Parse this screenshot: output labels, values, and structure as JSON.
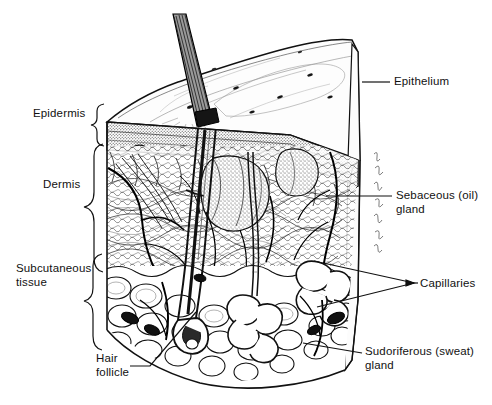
{
  "figure": {
    "style": "pen-and-ink line illustration, black on white",
    "background_color": "#ffffff",
    "ink_color": "#000000",
    "signature": "artist signature along right edge of block"
  },
  "labels": {
    "left": [
      {
        "id": "epidermis",
        "text": "Epidermis",
        "connector": "brace",
        "x": 33,
        "y": 107
      },
      {
        "id": "dermis",
        "text": "Dermis",
        "connector": "brace",
        "x": 43,
        "y": 178
      },
      {
        "id": "subcutaneous",
        "text": "Subcutaneous\ntissue",
        "connector": "brace",
        "x": 16,
        "y": 262
      }
    ],
    "right": [
      {
        "id": "epithelium",
        "text": "Epithelium",
        "connector": "line",
        "x": 394,
        "y": 75
      },
      {
        "id": "sebaceous",
        "text": "Sebaceous (oil)\ngland",
        "connector": "line",
        "x": 396,
        "y": 192
      },
      {
        "id": "capillaries",
        "text": "Capillaries",
        "connector": "v-line",
        "x": 420,
        "y": 277
      },
      {
        "id": "sudoriferous",
        "text": "Sudoriferous (sweat)\ngland",
        "connector": "line",
        "x": 365,
        "y": 348
      }
    ],
    "bottom_left": [
      {
        "id": "hair-follicle",
        "text": "Hair\nfollicle",
        "connector": "line",
        "x": 96,
        "y": 352
      }
    ]
  },
  "structures": [
    {
      "name": "skin-surface",
      "description": "top face of block with pores and texture lines"
    },
    {
      "name": "epithelium-band",
      "description": "stippled surface layer on cut faces"
    },
    {
      "name": "hair-shaft",
      "description": "thick dark hair emerging at an angle from top surface"
    },
    {
      "name": "hair-follicle",
      "description": "deep follicle sheath running down through dermis"
    },
    {
      "name": "sebaceous-gland",
      "description": "lobed stippled gland attached to follicle"
    },
    {
      "name": "sudoriferous-gland",
      "description": "coiled sweat gland in subcutaneous layer with duct"
    },
    {
      "name": "capillary-network",
      "description": "branching blood vessels through dermis and fat"
    },
    {
      "name": "fat-lobules",
      "description": "rounded adipose cells of subcutaneous tissue"
    },
    {
      "name": "connective-tissue",
      "description": "wavy collagen fibers filling the dermis"
    }
  ]
}
